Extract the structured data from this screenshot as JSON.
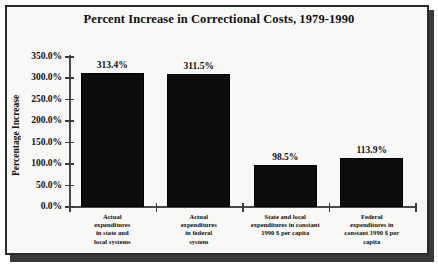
{
  "chart_data": {
    "type": "bar",
    "title": "Percent Increase in Correctional Costs, 1979-1990",
    "xlabel": "",
    "ylabel": "Percentage Increase",
    "ylim": [
      0,
      350
    ],
    "ytick_labels": [
      "350.0%",
      "300.0%",
      "250.0%",
      "200.0%",
      "150.0%",
      "100.0%",
      "50.0%",
      "0.0%"
    ],
    "ytick_values": [
      350,
      300,
      250,
      200,
      150,
      100,
      50,
      0
    ],
    "grid": false,
    "legend": false,
    "categories": [
      "Actual expenditures in state and local systems",
      "Actual expenditures in federal system",
      "State and local expenditures in constant 1990 $ per capita",
      "Federal expenditures in constant 1990 $ per capita"
    ],
    "category_lines": [
      [
        "Actual",
        "expenditures",
        "in state and",
        "local systems"
      ],
      [
        "Actual",
        "expenditures",
        "in federal",
        "system"
      ],
      [
        "State and local",
        "expenditures in constant",
        "1990 $ per capita"
      ],
      [
        "Federal",
        "expenditures in",
        "constant 1990 $ per",
        "capita"
      ]
    ],
    "values": [
      313.4,
      311.5,
      98.5,
      113.9
    ],
    "value_labels": [
      "313.4%",
      "311.5%",
      "98.5%",
      "113.9%"
    ],
    "bar_color": "#0d0d0d",
    "axis_color": "#4a4a4a",
    "text_color": "#111111",
    "background_color": "#f8f8f6",
    "frame_color": "#2b2b2b"
  }
}
